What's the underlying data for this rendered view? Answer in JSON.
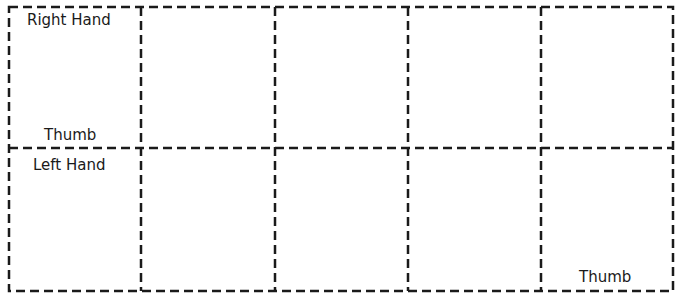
{
  "diagram": {
    "rows": 2,
    "columns": 5,
    "line_color": "#1a1a1a",
    "line_style": "dashed",
    "labels": {
      "right_hand": "Right Hand",
      "right_thumb": "Thumb",
      "left_hand": "Left Hand",
      "left_thumb": "Thumb"
    }
  }
}
